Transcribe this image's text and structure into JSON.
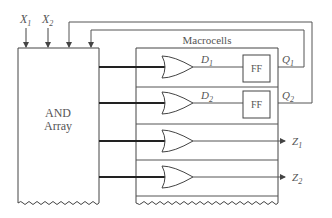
{
  "diagram": {
    "inputs": [
      {
        "name": "X",
        "sub": "1"
      },
      {
        "name": "X",
        "sub": "2"
      }
    ],
    "and_array": {
      "line1": "AND",
      "line2": "Array"
    },
    "macrocells": {
      "title": "Macrocells",
      "cells": [
        {
          "signal": "D",
          "sub": "1",
          "ff": "FF",
          "out": "Q",
          "out_sub": "1"
        },
        {
          "signal": "D",
          "sub": "2",
          "ff": "FF",
          "out": "Q",
          "out_sub": "2"
        },
        {
          "out": "Z",
          "out_sub": "1"
        },
        {
          "out": "Z",
          "out_sub": "2"
        }
      ]
    }
  }
}
